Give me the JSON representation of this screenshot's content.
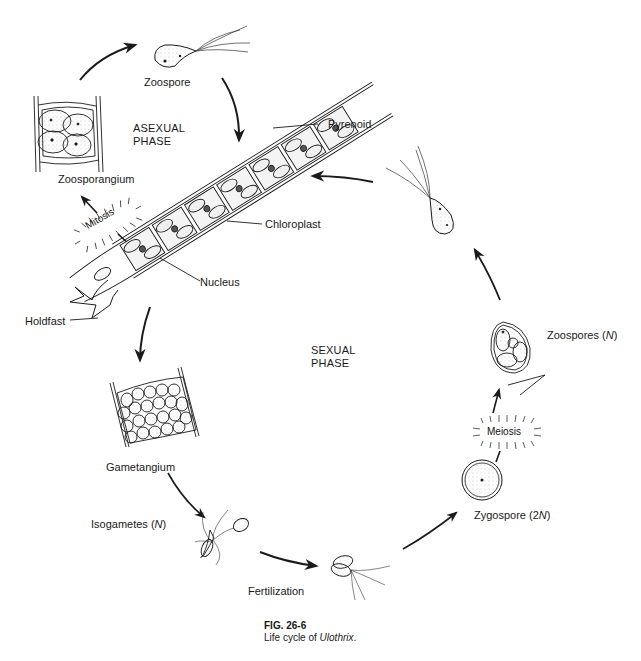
{
  "diagram": {
    "type": "life-cycle",
    "phases": {
      "asexual": [
        "ASEXUAL",
        "PHASE"
      ],
      "sexual": [
        "SEXUAL",
        "PHASE"
      ]
    },
    "structures": {
      "zoospore_top": "Zoospore",
      "zoosporangium": "Zoosporangium",
      "mitosis": "Mitosis",
      "pyrenoid": "Pyrenoid",
      "chloroplast": "Chloroplast",
      "nucleus": "Nucleus",
      "holdfast": "Holdfast",
      "gametangium": "Gametangium",
      "isogametes": "Isogametes (",
      "isogametes_n": "N",
      "isogametes_close": ")",
      "fertilization": "Fertilization",
      "zygospore": "Zygospore (2",
      "zygospore_n": "N",
      "zygospore_close": ")",
      "meiosis": "Meiosis",
      "zoospores": "Zoospores (",
      "zoospores_n": "N",
      "zoospores_close": ")"
    },
    "cycle_order": [
      "Filament (Ulothrix)",
      "Mitosis",
      "Zoosporangium",
      "Zoospore",
      "Filament",
      "Gametangium",
      "Isogametes (N)",
      "Fertilization",
      "Zygospore (2N)",
      "Meiosis",
      "Zoospores (N)",
      "Zoospore",
      "Filament"
    ]
  },
  "caption": {
    "number": "FIG. 26-6",
    "text_prefix": "Life cycle of ",
    "organism": "Ulothrix",
    "text_suffix": "."
  },
  "colors": {
    "ink": "#1a1a1a",
    "stipple": "#9a9a9a",
    "background": "#ffffff"
  }
}
